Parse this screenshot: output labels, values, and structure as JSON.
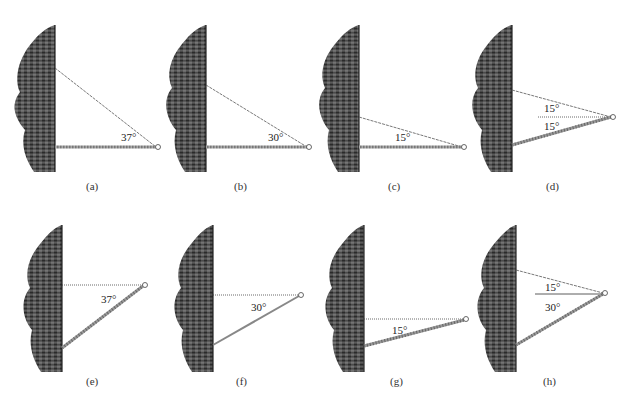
{
  "figure": {
    "panels": [
      {
        "id": "a",
        "caption": "(a)",
        "labels": [
          "37°"
        ],
        "type": "horizontal-rod-string-above"
      },
      {
        "id": "b",
        "caption": "(b)",
        "labels": [
          "30°"
        ],
        "type": "horizontal-rod-string-above"
      },
      {
        "id": "c",
        "caption": "(c)",
        "labels": [
          "15°"
        ],
        "type": "horizontal-rod-string-above"
      },
      {
        "id": "d",
        "caption": "(d)",
        "labels": [
          "15°",
          "15°"
        ],
        "type": "inclined-rod-string-above-dotted-horizontal"
      },
      {
        "id": "e",
        "caption": "(e)",
        "labels": [
          "37°"
        ],
        "type": "inclined-rod-dotted-horizontal"
      },
      {
        "id": "f",
        "caption": "(f)",
        "labels": [
          "30°"
        ],
        "type": "inclined-rod-dotted-horizontal"
      },
      {
        "id": "g",
        "caption": "(g)",
        "labels": [
          "15°"
        ],
        "type": "inclined-rod-dotted-horizontal"
      },
      {
        "id": "h",
        "caption": "(h)",
        "labels": [
          "15°",
          "30°"
        ],
        "type": "inclined-rod-string-above-solid-horizontal"
      }
    ],
    "colors": {
      "wall": "#3a3a3a",
      "rod": "#9a9a9a",
      "string": "#555555",
      "background": "#ffffff"
    }
  }
}
